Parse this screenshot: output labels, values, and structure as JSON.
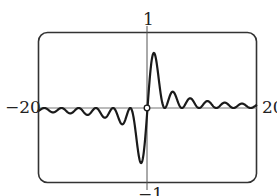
{
  "chart_data": {
    "type": "line",
    "title": "",
    "xlabel": "",
    "ylabel": "",
    "function": "y = sin^2(x) / x",
    "xlim": [
      -20,
      20
    ],
    "ylim": [
      -1,
      1
    ],
    "grid": false,
    "legend": null,
    "tick_labels": {
      "x_min": "−20",
      "x_max": "20",
      "y_max": "1",
      "y_min": "−1"
    },
    "annotations": [
      {
        "type": "open-circle",
        "x": 0,
        "y": 0,
        "note": "removable discontinuity at origin"
      }
    ],
    "series": [
      {
        "name": "f(x)",
        "x": [
          -20,
          -18.85,
          -17.28,
          -15.71,
          -14.14,
          -12.57,
          -11.0,
          -9.42,
          -7.85,
          -6.28,
          -4.71,
          -3.14,
          -1.57,
          -1.17,
          0,
          1.17,
          1.57,
          3.14,
          4.71,
          6.28,
          7.85,
          9.42,
          11.0,
          12.57,
          14.14,
          15.71,
          17.28,
          18.85,
          20
        ],
        "values": [
          -0.042,
          0.0,
          -0.058,
          0.0,
          -0.071,
          0.0,
          -0.091,
          0.0,
          -0.127,
          0.0,
          -0.212,
          0.0,
          -0.637,
          -0.725,
          null,
          0.725,
          0.637,
          0.0,
          0.212,
          0.0,
          0.127,
          0.0,
          0.091,
          0.0,
          0.071,
          0.0,
          0.058,
          0.0,
          0.042
        ]
      }
    ],
    "colors": {
      "curve": "#1a1a1a",
      "axes": "#555555",
      "frame": "#333333",
      "background": "#ffffff"
    }
  }
}
